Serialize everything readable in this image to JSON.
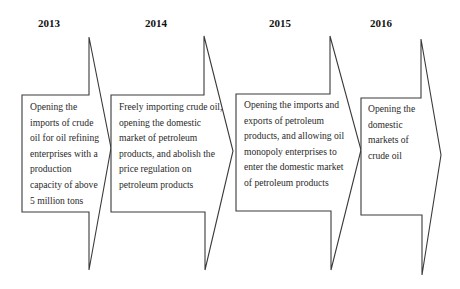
{
  "diagram": {
    "type": "timeline-chevron",
    "stroke_color": "#3a3a3a",
    "steps": [
      {
        "year": "2013",
        "description": "Opening the imports of crude oil for oil refining enterprises with a production capacity of above 5 million tons",
        "lines": [
          "Opening the",
          "imports of crude",
          "oil for oil refining",
          "enterprises with a",
          "production",
          "capacity of above",
          "5 million tons"
        ]
      },
      {
        "year": "2014",
        "description": "Freely importing crude oil, opening the domestic market of petroleum products, and abolish the price regulation on petroleum products",
        "lines": [
          "Freely importing crude oil,",
          "opening the domestic",
          "market of petroleum",
          "products, and abolish the",
          "price regulation on",
          "petroleum products"
        ]
      },
      {
        "year": "2015",
        "description": "Opening the imports and exports of petroleum products, and allowing oil monopoly enterprises to enter the domestic market of petroleum products",
        "lines": [
          "Opening the imports and",
          "exports of petroleum",
          "products, and allowing oil",
          "monopoly enterprises to",
          "enter the domestic market",
          "of petroleum products"
        ]
      },
      {
        "year": "2016",
        "description": "Opening the domestic markets of crude oil",
        "lines": [
          "Opening the",
          "domestic",
          "markets of",
          "crude oil"
        ]
      }
    ]
  }
}
